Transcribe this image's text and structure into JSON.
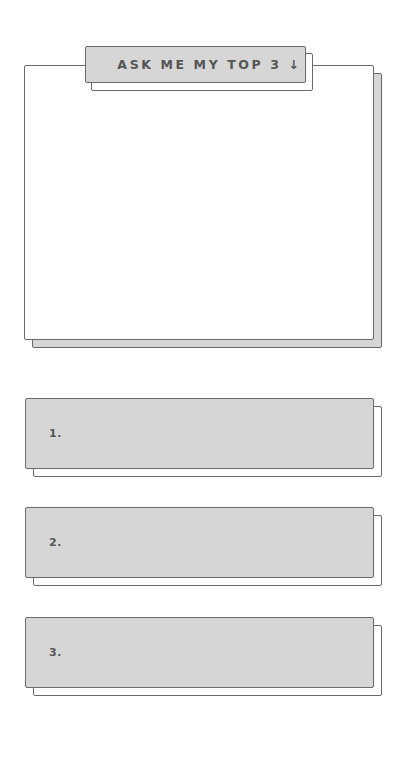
{
  "header": {
    "label": "ASK ME MY TOP 3 ↓",
    "arrow_icon": "arrow-down-icon"
  },
  "answer_area": {
    "content": ""
  },
  "top_list": [
    {
      "number": "1.",
      "value": ""
    },
    {
      "number": "2.",
      "value": ""
    },
    {
      "number": "3.",
      "value": ""
    }
  ],
  "colors": {
    "paper": "#ffffff",
    "panel_gray": "#d6d6d6",
    "outline": "#6a6a6a",
    "text": "#555555"
  }
}
